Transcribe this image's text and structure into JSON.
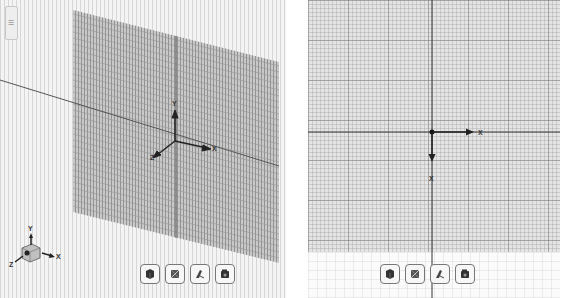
{
  "left_view": {
    "name": "3D perspective viewport",
    "origin_triad": {
      "x_label": "X",
      "y_label": "Y",
      "z_label": "Z"
    },
    "view_cube_triad": {
      "x_label": "X",
      "y_label": "Y",
      "z_label": "Z"
    },
    "side_tab_label": "☰",
    "toolbar": [
      {
        "name": "shaded-view-button",
        "icon": "cube-icon"
      },
      {
        "name": "wireframe-view-button",
        "icon": "wireframe-icon"
      },
      {
        "name": "draw-style-button",
        "icon": "pen-icon"
      },
      {
        "name": "camera-view-button",
        "icon": "camera-icon"
      }
    ]
  },
  "right_view": {
    "name": "2D top viewport",
    "origin_triad": {
      "x_label": "X",
      "y_label": "X"
    },
    "toolbar": [
      {
        "name": "shaded-view-button",
        "icon": "cube-icon"
      },
      {
        "name": "wireframe-view-button",
        "icon": "wireframe-icon"
      },
      {
        "name": "draw-style-button",
        "icon": "pen-icon"
      },
      {
        "name": "camera-view-button",
        "icon": "camera-icon"
      }
    ]
  },
  "colors": {
    "background": "#f4f4f4",
    "grid_dark": "#8a8a8a",
    "grid_light": "#d2d2d2",
    "axis_line": "#333333"
  }
}
